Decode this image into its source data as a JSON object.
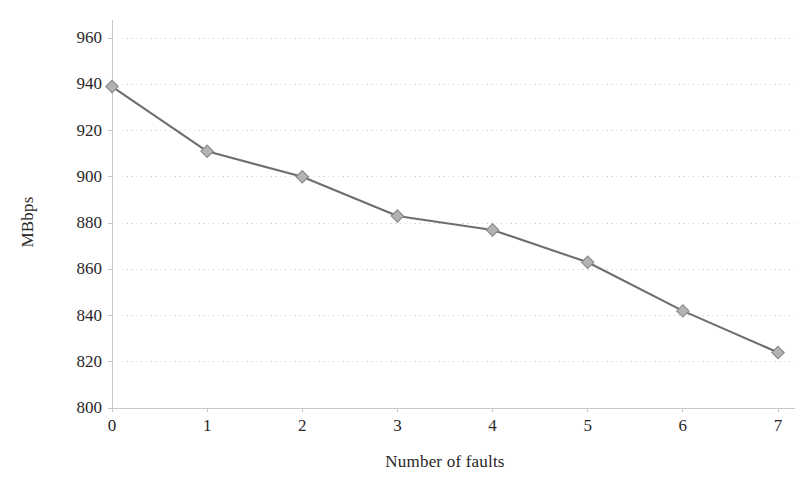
{
  "chart_data": {
    "type": "line",
    "title": "",
    "xlabel": "Number of faults",
    "ylabel": "MBbps",
    "x": [
      0,
      1,
      2,
      3,
      4,
      5,
      6,
      7
    ],
    "values": [
      939,
      911,
      900,
      883,
      877,
      863,
      842,
      824
    ],
    "series": [
      {
        "name": "throughput",
        "values": [
          939,
          911,
          900,
          883,
          877,
          863,
          842,
          824
        ]
      }
    ],
    "xlim": [
      0,
      7
    ],
    "ylim": [
      800,
      960
    ],
    "xticks": [
      "0",
      "1",
      "2",
      "3",
      "4",
      "5",
      "6",
      "7"
    ],
    "yticks": [
      "800",
      "820",
      "840",
      "860",
      "880",
      "900",
      "920",
      "940",
      "960"
    ],
    "ytick_step": 20,
    "grid": "horizontal-dotted",
    "legend": "none",
    "marker": "diamond",
    "line_color": "#6e6e6e",
    "marker_fill": "#b3b3b3",
    "marker_stroke": "#8a8a8a",
    "grid_color": "#d9d9d9",
    "axis_color": "#c8c8c8",
    "background": "#ffffff",
    "text_color": "#2a2627"
  }
}
